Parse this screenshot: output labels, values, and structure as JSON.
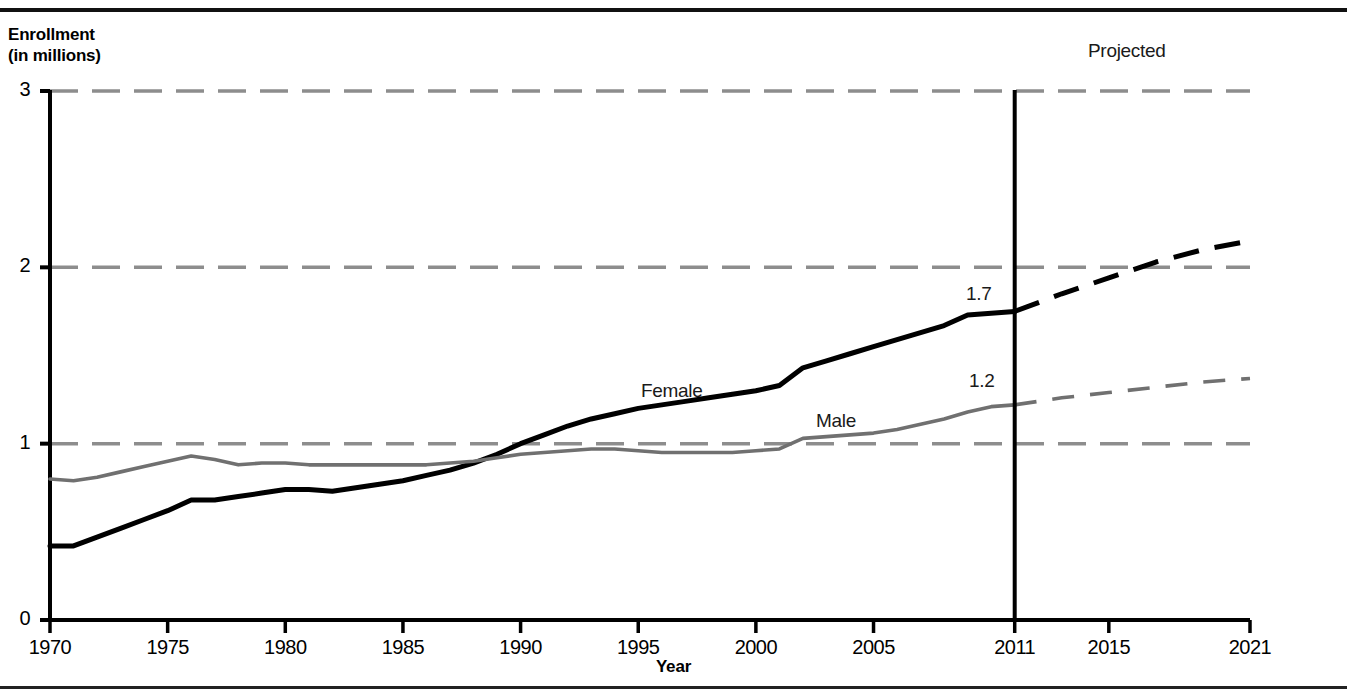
{
  "axes": {
    "y_title": "Enrollment\n(in millions)",
    "x_title": "Year",
    "y_ticks": [
      "0",
      "1",
      "2",
      "3"
    ],
    "x_ticks": [
      "1970",
      "1975",
      "1980",
      "1985",
      "1990",
      "1995",
      "2000",
      "2005",
      "2011",
      "2015",
      "2021"
    ]
  },
  "annotations": {
    "projected": "Projected",
    "female_label": "Female",
    "male_label": "Male",
    "female_value_2011": "1.7",
    "male_value_2011": "1.2"
  },
  "colors": {
    "female": "#000000",
    "male": "#707070",
    "gridline": "#8d8d8d",
    "axis": "#000000",
    "background": "#ffffff"
  },
  "chart_data": {
    "type": "line",
    "title": "",
    "xlabel": "Year",
    "ylabel": "Enrollment (in millions)",
    "xlim": [
      1970,
      2021
    ],
    "ylim": [
      0,
      3
    ],
    "grid": true,
    "gridlines_y": [
      1,
      2,
      3
    ],
    "legend": "inline-labels",
    "projection_start_year": 2011,
    "projection_divider_label": "Projected",
    "x": [
      1970,
      1971,
      1972,
      1973,
      1974,
      1975,
      1976,
      1977,
      1978,
      1979,
      1980,
      1981,
      1982,
      1983,
      1984,
      1985,
      1986,
      1987,
      1988,
      1989,
      1990,
      1991,
      1992,
      1993,
      1994,
      1995,
      1996,
      1997,
      1998,
      1999,
      2000,
      2001,
      2002,
      2003,
      2004,
      2005,
      2006,
      2007,
      2008,
      2009,
      2010,
      2011
    ],
    "series": [
      {
        "name": "Female",
        "style": "solid",
        "color": "#000000",
        "values": [
          0.42,
          0.42,
          0.47,
          0.52,
          0.57,
          0.62,
          0.68,
          0.68,
          0.7,
          0.72,
          0.74,
          0.74,
          0.73,
          0.75,
          0.77,
          0.79,
          0.82,
          0.85,
          0.89,
          0.94,
          1.0,
          1.05,
          1.1,
          1.14,
          1.17,
          1.2,
          1.22,
          1.24,
          1.26,
          1.28,
          1.3,
          1.33,
          1.43,
          1.47,
          1.51,
          1.55,
          1.59,
          1.63,
          1.67,
          1.73,
          1.74,
          1.75
        ],
        "label_at_2011": "1.7",
        "projection": {
          "style": "dashed",
          "x": [
            2011,
            2013,
            2015,
            2017,
            2019,
            2021
          ],
          "values": [
            1.75,
            1.85,
            1.94,
            2.03,
            2.1,
            2.15
          ]
        }
      },
      {
        "name": "Male",
        "style": "solid",
        "color": "#707070",
        "values": [
          0.8,
          0.79,
          0.81,
          0.84,
          0.87,
          0.9,
          0.93,
          0.91,
          0.88,
          0.89,
          0.89,
          0.88,
          0.88,
          0.88,
          0.88,
          0.88,
          0.88,
          0.89,
          0.9,
          0.92,
          0.94,
          0.95,
          0.96,
          0.97,
          0.97,
          0.96,
          0.95,
          0.95,
          0.95,
          0.95,
          0.96,
          0.97,
          1.03,
          1.04,
          1.05,
          1.06,
          1.08,
          1.11,
          1.14,
          1.18,
          1.21,
          1.22
        ],
        "label_at_2011": "1.2",
        "projection": {
          "style": "dashed",
          "x": [
            2011,
            2013,
            2015,
            2017,
            2019,
            2021
          ],
          "values": [
            1.22,
            1.26,
            1.29,
            1.32,
            1.35,
            1.37
          ]
        }
      }
    ]
  }
}
